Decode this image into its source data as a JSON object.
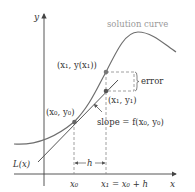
{
  "diagram": {
    "colors": {
      "axis": "#444444",
      "curve": "#6e6e6e",
      "tangent": "#555555",
      "dashed": "#888888",
      "point": "#666666",
      "caption": "#999999",
      "text": "#333333"
    },
    "axes": {
      "x_label": "x",
      "y_label": "y"
    },
    "labels": {
      "solution_curve": "solution curve",
      "point_exact": "(x₁, y(x₁))",
      "point_approx": "(x₁, y₁)",
      "point_initial": "(x₀, y₀)",
      "error": "error",
      "slope": "slope = f(x₀, y₀)",
      "tangent_line": "L(x)",
      "step": "h",
      "tick_x0": "x₀",
      "tick_x1": "x₁ = x₀ + h"
    }
  }
}
